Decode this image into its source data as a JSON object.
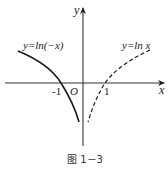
{
  "figure": {
    "caption": "图 1－3",
    "axes": {
      "x_label": "x",
      "y_label": "y",
      "origin_label": "O",
      "tick_labels": [
        "-1",
        "1"
      ]
    },
    "curves": [
      {
        "label": "y=ln(−x)",
        "style": "solid",
        "domain": "x<0",
        "passes_through": [
          -1,
          0
        ]
      },
      {
        "label": "y=ln x",
        "style": "dashed",
        "domain": "x>0",
        "passes_through": [
          1,
          0
        ]
      }
    ],
    "colors": {
      "axis": "#333333",
      "curve": "#1a1a1a",
      "background": "#ffffff"
    }
  }
}
